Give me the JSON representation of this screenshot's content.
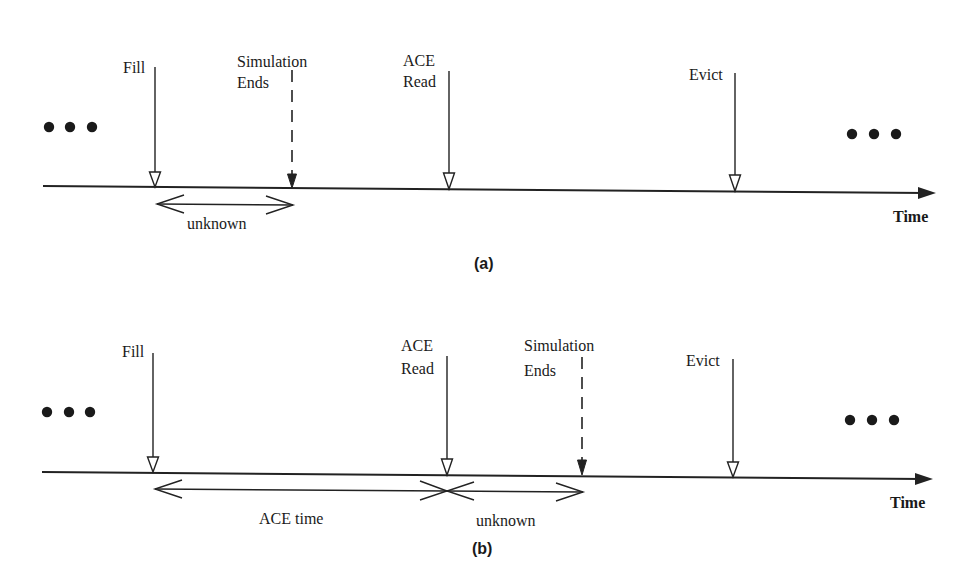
{
  "figure": {
    "panels": [
      {
        "id": "a",
        "caption": "(a)",
        "axis_label": "Time",
        "events": [
          {
            "name": "fill",
            "label_lines": [
              "Fill"
            ],
            "style": "solid-hollow-head"
          },
          {
            "name": "simulation-ends",
            "label_lines": [
              "Simulation",
              "Ends"
            ],
            "style": "dashed-filled-head"
          },
          {
            "name": "ace-read",
            "label_lines": [
              "ACE",
              "Read"
            ],
            "style": "solid-hollow-head"
          },
          {
            "name": "evict",
            "label_lines": [
              "Evict"
            ],
            "style": "solid-hollow-head"
          }
        ],
        "intervals": [
          {
            "from": "fill",
            "to": "simulation-ends",
            "label": "unknown"
          }
        ],
        "ellipsis_left": "•••",
        "ellipsis_right": "•••"
      },
      {
        "id": "b",
        "caption": "(b)",
        "axis_label": "Time",
        "events": [
          {
            "name": "fill",
            "label_lines": [
              "Fill"
            ],
            "style": "solid-hollow-head"
          },
          {
            "name": "ace-read",
            "label_lines": [
              "ACE",
              "Read"
            ],
            "style": "solid-hollow-head"
          },
          {
            "name": "simulation-ends",
            "label_lines": [
              "Simulation",
              "Ends"
            ],
            "style": "dashed-filled-head"
          },
          {
            "name": "evict",
            "label_lines": [
              "Evict"
            ],
            "style": "solid-hollow-head"
          }
        ],
        "intervals": [
          {
            "from": "fill",
            "to": "ace-read",
            "label": "ACE time"
          },
          {
            "from": "ace-read",
            "to": "simulation-ends",
            "label": "unknown"
          }
        ],
        "ellipsis_left": "•••",
        "ellipsis_right": "•••"
      }
    ]
  }
}
